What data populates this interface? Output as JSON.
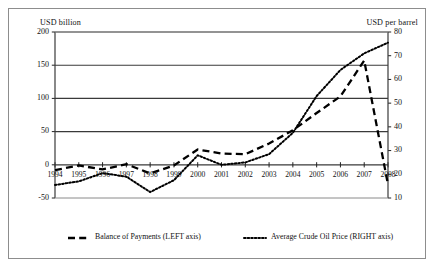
{
  "chart_data": {
    "type": "line",
    "title": "",
    "subtitle": "",
    "xlabel": "",
    "ylabel": "USD billion",
    "y2label": "USD per barrel",
    "grid": true,
    "legend_position": "bottom",
    "categories": [
      "1994",
      "1995",
      "1996",
      "1997",
      "1998",
      "1999",
      "2000",
      "2001",
      "2002",
      "2003",
      "2004",
      "2005",
      "2006",
      "2007",
      "2008"
    ],
    "yticks_left": [
      "-50",
      "0",
      "50",
      "100",
      "150",
      "200"
    ],
    "yticks_right": [
      "10",
      "20",
      "30",
      "40",
      "50",
      "60",
      "70",
      "80"
    ],
    "ylim": [
      -50,
      200
    ],
    "y2lim": [
      10,
      80
    ],
    "series": [
      {
        "name": "Balance of Payments (LEFT axis)",
        "axis": "left",
        "style": "dashed",
        "values": [
          -8,
          -1,
          -7,
          1,
          -13,
          -1,
          23,
          17,
          16,
          32,
          52,
          78,
          103,
          157,
          -30
        ]
      },
      {
        "name": "Average Crude Oil Price (RIGHT axis)",
        "axis": "right",
        "style": "dotted",
        "values": [
          15.5,
          17,
          20.5,
          19,
          12.5,
          17.5,
          28,
          24,
          25,
          28.5,
          37.5,
          53,
          64,
          71,
          75.5
        ]
      }
    ]
  },
  "axes": {
    "left_title": "USD billion",
    "right_title": "USD per barrel"
  },
  "legend": {
    "items": [
      {
        "label": "Balance of Payments (LEFT axis)",
        "marker": "dashed-line-marker"
      },
      {
        "label": "Average Crude Oil  Price  (RIGHT axis)",
        "marker": "dotted-line-marker"
      }
    ]
  },
  "colors": {
    "series_line": "#000000",
    "grid": "#3a3a3a",
    "frame": "#8d8d8d",
    "background": "#ffffff"
  }
}
